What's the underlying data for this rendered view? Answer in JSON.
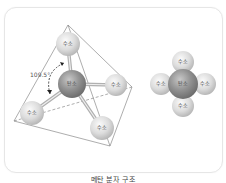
{
  "figure": {
    "caption": "메탄 분자 구조",
    "tetrahedral_model": {
      "angle_label": "109.5°",
      "center_atom": {
        "label": "탄소",
        "element": "carbon"
      },
      "outer_atoms": [
        {
          "label": "수소",
          "element": "hydrogen",
          "position": "top"
        },
        {
          "label": "수소",
          "element": "hydrogen",
          "position": "right"
        },
        {
          "label": "수소",
          "element": "hydrogen",
          "position": "bottom-left"
        },
        {
          "label": "수소",
          "element": "hydrogen",
          "position": "bottom-right"
        }
      ]
    },
    "space_filling_model": {
      "center_atom": {
        "label": "탄소",
        "element": "carbon"
      },
      "outer_atoms": [
        {
          "label": "수소",
          "position": "top"
        },
        {
          "label": "수소",
          "position": "left"
        },
        {
          "label": "수소",
          "position": "right"
        },
        {
          "label": "수소",
          "position": "bottom"
        }
      ]
    },
    "colors": {
      "hydrogen": "#d9d9d9",
      "carbon": "#8f8f8f",
      "outline": "#888888",
      "frame_border": "#e6e6e6"
    }
  }
}
